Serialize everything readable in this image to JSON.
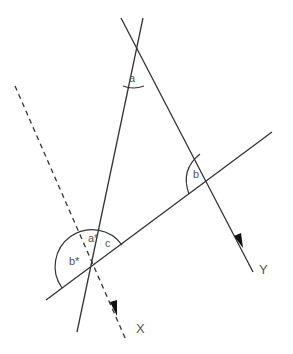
{
  "diagram": {
    "title": "",
    "colors": {
      "line": "#333333",
      "text": "#555555",
      "background": "#ffffff"
    },
    "angle_labels": {
      "a": "a",
      "b": "b",
      "c": "c",
      "a_star": "a*",
      "b_star": "b*"
    },
    "ray_labels": {
      "x": "X",
      "y": "Y"
    },
    "elements": [
      {
        "id": "line-left",
        "style": "solid",
        "from": [
          143,
          18
        ],
        "to": [
          77,
          332
        ]
      },
      {
        "id": "line-right",
        "style": "solid",
        "from": [
          121,
          18
        ],
        "to": [
          253,
          272
        ],
        "arrow": true,
        "label": "Y"
      },
      {
        "id": "transversal",
        "style": "solid",
        "from": [
          46,
          300
        ],
        "to": [
          272,
          132
        ]
      },
      {
        "id": "dashed-line",
        "style": "dashed",
        "from": [
          15,
          86
        ],
        "to": [
          126,
          340
        ],
        "arrow": true,
        "label": "X"
      }
    ]
  }
}
